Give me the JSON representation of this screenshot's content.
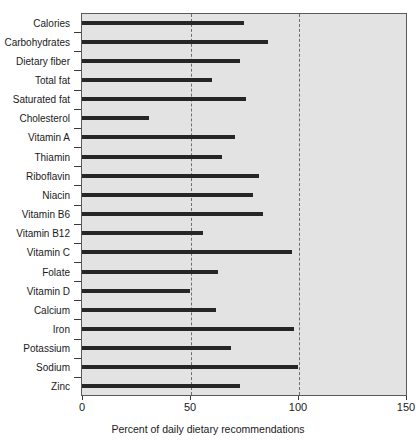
{
  "chart_data": {
    "type": "bar",
    "orientation": "horizontal",
    "title": "",
    "xlabel": "Percent of daily dietary recommendations",
    "ylabel": "",
    "xlim": [
      0,
      150
    ],
    "xticks": [
      0,
      50,
      100,
      150
    ],
    "xtick_labels": [
      "0",
      "50",
      "100",
      "150"
    ],
    "gridlines": [
      50,
      100
    ],
    "grid": "vertical dashed at 50 and 100",
    "legend": null,
    "bar_color": "#262626",
    "plot_background": "#e3e3e3",
    "categories": [
      "Calories",
      "Carbohydrates",
      "Dietary fiber",
      "Total fat",
      "Saturated fat",
      "Cholesterol",
      "Vitamin A",
      "Thiamin",
      "Riboflavin",
      "Niacin",
      "Vitamin B6",
      "Vitamin B12",
      "Vitamin C",
      "Folate",
      "Vitamin D",
      "Calcium",
      "Iron",
      "Potassium",
      "Sodium",
      "Zinc"
    ],
    "values": [
      75,
      86,
      73,
      60,
      76,
      31,
      71,
      65,
      82,
      79,
      84,
      56,
      97,
      63,
      50,
      62,
      98,
      69,
      100,
      73
    ]
  }
}
